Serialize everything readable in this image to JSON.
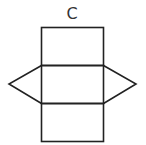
{
  "diagram": {
    "label": "C",
    "type": "triangular-prism-net",
    "stroke_color": "#222222",
    "background": "#ffffff"
  }
}
